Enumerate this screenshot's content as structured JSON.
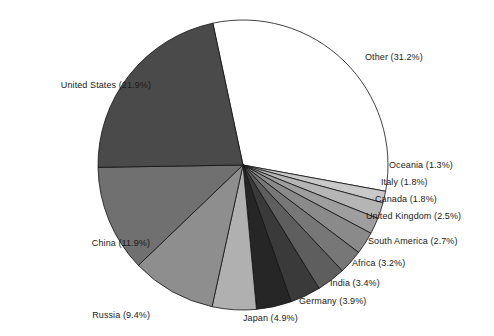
{
  "chart_data": {
    "type": "pie",
    "title": "",
    "subtitle": "",
    "xlabel": "",
    "ylabel": "",
    "legend_position": "outside-labels",
    "grid": false,
    "units": "percent",
    "start_angle_deg": -102,
    "direction": "clockwise",
    "categories": [
      "Other",
      "Oceania",
      "Italy",
      "Canada",
      "United Kingdom",
      "South America",
      "Africa",
      "India",
      "Germany",
      "Japan",
      "Russia",
      "China",
      "United States"
    ],
    "values": [
      31.2,
      1.3,
      1.8,
      1.8,
      2.5,
      2.7,
      3.2,
      3.4,
      3.9,
      4.9,
      9.4,
      11.9,
      21.9
    ],
    "slices": [
      {
        "label": "Other",
        "value": 31.2,
        "text": "Other (31.2%)",
        "color": "#ffffff"
      },
      {
        "label": "Oceania",
        "value": 1.3,
        "text": "Oceania (1.3%)",
        "color": "#c9c9c9"
      },
      {
        "label": "Italy",
        "value": 1.8,
        "text": "Italy (1.8%)",
        "color": "#b5b5b5"
      },
      {
        "label": "Canada",
        "value": 1.8,
        "text": "Canada (1.8%)",
        "color": "#9e9e9e"
      },
      {
        "label": "United Kingdom",
        "value": 2.5,
        "text": "United Kingdom (2.5%)",
        "color": "#8a8a8a"
      },
      {
        "label": "South America",
        "value": 2.7,
        "text": "South America (2.7%)",
        "color": "#777777"
      },
      {
        "label": "Africa",
        "value": 3.2,
        "text": "Africa (3.2%)",
        "color": "#5e5e5e"
      },
      {
        "label": "India",
        "value": 3.4,
        "text": "India (3.4%)",
        "color": "#3a3a3a"
      },
      {
        "label": "Germany",
        "value": 3.9,
        "text": "Germany (3.9%)",
        "color": "#262626"
      },
      {
        "label": "Japan",
        "value": 4.9,
        "text": "Japan (4.9%)",
        "color": "#b0b0b0"
      },
      {
        "label": "Russia",
        "value": 9.4,
        "text": "Russia (9.4%)",
        "color": "#8e8e8e"
      },
      {
        "label": "China",
        "value": 11.9,
        "text": "China (11.9%)",
        "color": "#707070"
      },
      {
        "label": "United States",
        "value": 21.9,
        "text": "United States (21.9%)",
        "color": "#4a4a4a"
      }
    ],
    "geometry": {
      "center_x": 243,
      "center_y": 165,
      "radius": 145,
      "stroke": "#111111",
      "stroke_width": 0.8
    },
    "label_positions": [
      {
        "key": "other",
        "left": 365,
        "top": 52,
        "align": "left"
      },
      {
        "key": "oceania",
        "left": 389,
        "top": 160,
        "align": "left"
      },
      {
        "key": "italy",
        "left": 381,
        "top": 177,
        "align": "left"
      },
      {
        "key": "canada",
        "left": 375,
        "top": 194,
        "align": "left"
      },
      {
        "key": "united_kingdom",
        "left": 366,
        "top": 211,
        "align": "left"
      },
      {
        "key": "south_america",
        "left": 368,
        "top": 236,
        "align": "left"
      },
      {
        "key": "africa",
        "left": 352,
        "top": 258,
        "align": "left"
      },
      {
        "key": "india",
        "left": 330,
        "top": 278,
        "align": "left"
      },
      {
        "key": "germany",
        "left": 299,
        "top": 296,
        "align": "left"
      },
      {
        "key": "japan",
        "left": 243,
        "top": 313,
        "align": "left"
      },
      {
        "key": "russia",
        "left": 150,
        "top": 310,
        "align": "right"
      },
      {
        "key": "china",
        "left": 150,
        "top": 238,
        "align": "right"
      },
      {
        "key": "united_states",
        "left": 151,
        "top": 80,
        "align": "right"
      }
    ],
    "labels": {
      "other": "Other (31.2%)",
      "oceania": "Oceania (1.3%)",
      "italy": "Italy (1.8%)",
      "canada": "Canada (1.8%)",
      "united_kingdom": "United Kingdom (2.5%)",
      "south_america": "South America (2.7%)",
      "africa": "Africa (3.2%)",
      "india": "India (3.4%)",
      "germany": "Germany (3.9%)",
      "japan": "Japan (4.9%)",
      "russia": "Russia (9.4%)",
      "china": "China (11.9%)",
      "united_states": "United States (21.9%)"
    }
  }
}
